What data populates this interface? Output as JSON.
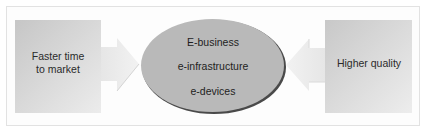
{
  "diagram": {
    "left_box": {
      "label": "Faster time\nto market",
      "line1": "Faster time",
      "line2": "to market"
    },
    "right_box": {
      "label": "Higher quality"
    },
    "center": {
      "items": [
        "E-business",
        "e-infrastructure",
        "e-devices"
      ]
    },
    "colors": {
      "box_fill_dark": "#c9c9c9",
      "box_fill_light": "#eeeeee",
      "arrow_fill": "#ebebeb",
      "ellipse_fill": "#b8b8b8",
      "ellipse_shadow": "#4a4a4a",
      "frame_border": "#e2e2e2"
    }
  }
}
